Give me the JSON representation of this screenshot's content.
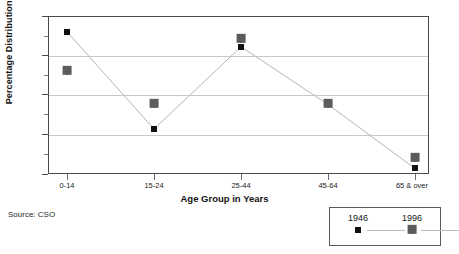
{
  "chart_data": {
    "type": "line",
    "title": "",
    "xlabel": "Age Group in Years",
    "ylabel": "Percentage Distribution %",
    "categories": [
      "0-14",
      "15-24",
      "25-44",
      "45-64",
      "65 & over"
    ],
    "series": [
      {
        "name": "1946",
        "marker": "square",
        "connected": true,
        "color": "#111111",
        "values": [
          28.0,
          15.7,
          26.1,
          18.8,
          10.7
        ]
      },
      {
        "name": "1996",
        "marker": "diamond",
        "connected": false,
        "color": "#5c5c5c",
        "values": [
          23.0,
          18.8,
          27.1,
          18.8,
          12.0
        ]
      }
    ],
    "ylim": [
      10,
      30
    ],
    "yticks": [
      10,
      15,
      20,
      25,
      30
    ],
    "ytick_labels": [
      "10",
      "15",
      "20",
      "25",
      "30"
    ],
    "yminor_ticks": [
      12.5,
      17.5,
      22.5,
      27.5
    ],
    "grid": true,
    "grid_axis": "y",
    "legend_position": "bottom-right"
  },
  "source": {
    "note": "Source: CSO"
  },
  "legend": {
    "items": [
      {
        "label": "1946"
      },
      {
        "label": "1996"
      }
    ]
  }
}
